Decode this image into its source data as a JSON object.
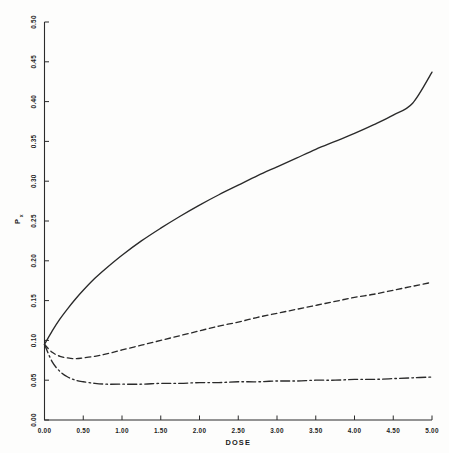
{
  "chart_data": {
    "type": "line",
    "title": "",
    "xlabel": "DOSE",
    "ylabel": "Px",
    "ylabel_base": "P",
    "ylabel_subscript": "x",
    "xlim": [
      0.0,
      5.0
    ],
    "ylim": [
      0.0,
      0.5
    ],
    "grid": false,
    "legend": "none",
    "x_ticks": [
      "0.00",
      "0.50",
      "1.00",
      "1.50",
      "2.00",
      "2.50",
      "3.00",
      "3.50",
      "4.00",
      "4.50",
      "5.00"
    ],
    "x_tick_values": [
      0.0,
      0.5,
      1.0,
      1.5,
      2.0,
      2.5,
      3.0,
      3.5,
      4.0,
      4.5,
      5.0
    ],
    "y_ticks": [
      "0.00",
      "0.05",
      "0.10",
      "0.15",
      "0.20",
      "0.25",
      "0.30",
      "0.35",
      "0.40",
      "0.45",
      "0.50"
    ],
    "y_tick_values": [
      0.0,
      0.05,
      0.1,
      0.15,
      0.2,
      0.25,
      0.3,
      0.35,
      0.4,
      0.45,
      0.5
    ],
    "x": [
      0.0,
      0.1,
      0.2,
      0.3,
      0.4,
      0.5,
      0.65,
      0.8,
      1.0,
      1.25,
      1.5,
      1.75,
      2.0,
      2.25,
      2.5,
      2.75,
      3.0,
      3.25,
      3.5,
      3.75,
      4.0,
      4.25,
      4.5,
      4.75,
      5.0
    ],
    "series": [
      {
        "name": "solid-curve",
        "style": "solid",
        "color": "#2a2a2a",
        "values": [
          0.095,
          0.112,
          0.127,
          0.14,
          0.152,
          0.163,
          0.178,
          0.191,
          0.207,
          0.225,
          0.241,
          0.256,
          0.27,
          0.283,
          0.295,
          0.307,
          0.318,
          0.329,
          0.34,
          0.35,
          0.36,
          0.371,
          0.383,
          0.398,
          0.437
        ]
      },
      {
        "name": "dashed-curve",
        "style": "dashed",
        "color": "#2a2a2a",
        "values": [
          0.095,
          0.085,
          0.08,
          0.078,
          0.077,
          0.078,
          0.08,
          0.083,
          0.088,
          0.094,
          0.1,
          0.106,
          0.112,
          0.118,
          0.123,
          0.129,
          0.134,
          0.139,
          0.144,
          0.149,
          0.154,
          0.158,
          0.163,
          0.168,
          0.173
        ]
      },
      {
        "name": "dashdot-curve",
        "style": "dashdot",
        "color": "#2a2a2a",
        "values": [
          0.095,
          0.073,
          0.061,
          0.054,
          0.05,
          0.048,
          0.046,
          0.045,
          0.045,
          0.045,
          0.046,
          0.046,
          0.047,
          0.047,
          0.048,
          0.048,
          0.049,
          0.049,
          0.05,
          0.05,
          0.051,
          0.051,
          0.052,
          0.053,
          0.054
        ]
      }
    ]
  }
}
